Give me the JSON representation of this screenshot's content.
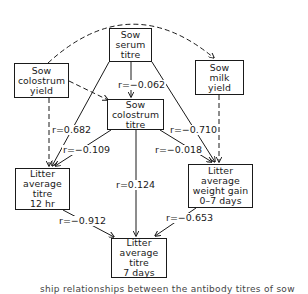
{
  "diagram": {
    "type": "path-diagram",
    "nodes": {
      "sow_serum_titre": {
        "lines": [
          "Sow",
          "serum",
          "titre"
        ]
      },
      "sow_colostrum_yield": {
        "lines": [
          "Sow",
          "colostrum",
          "yield"
        ]
      },
      "sow_milk_yield": {
        "lines": [
          "Sow",
          "milk",
          "yield"
        ]
      },
      "sow_colostrum_titre": {
        "lines": [
          "Sow",
          "colostrum",
          "titre"
        ]
      },
      "litter_titre_12hr": {
        "lines": [
          "Litter",
          "average",
          "titre",
          "12 hr"
        ]
      },
      "litter_weight_gain": {
        "lines": [
          "Litter",
          "average",
          "weight gain",
          "0–7 days"
        ]
      },
      "litter_titre_7days": {
        "lines": [
          "Litter",
          "average",
          "titre",
          "7 days"
        ]
      }
    },
    "correlations": {
      "serum_to_colostrum_titre": "r=−0.062",
      "colostrum_yield_to_12hr": "r=0.682",
      "colostrum_titre_to_12hr": "r=−0.109",
      "serum_to_weight_gain": "r=−0.710",
      "colostrum_titre_to_weight_gain": "r=−0.018",
      "colostrum_titre_to_7days": "r=0.124",
      "titre_12hr_to_7days": "r=−0.912",
      "weight_gain_to_7days": "r=−0.653"
    },
    "edges": [
      {
        "from": "Sow colostrum yield",
        "to": "Sow milk yield",
        "style": "dashed-arc"
      },
      {
        "from": "Sow colostrum yield",
        "to": "Sow colostrum titre",
        "style": "dashed"
      },
      {
        "from": "Sow colostrum yield",
        "to": "Litter average titre 12 hr",
        "style": "dashed"
      },
      {
        "from": "Sow milk yield",
        "to": "Litter average weight gain 0–7 days",
        "style": "dashed"
      },
      {
        "from": "Sow serum titre",
        "to": "Sow colostrum titre",
        "style": "solid"
      },
      {
        "from": "Sow serum titre",
        "to": "Litter average titre 12 hr",
        "style": "solid"
      },
      {
        "from": "Sow serum titre",
        "to": "Litter average weight gain 0–7 days",
        "style": "solid"
      },
      {
        "from": "Sow colostrum titre",
        "to": "Litter average titre 12 hr",
        "style": "solid"
      },
      {
        "from": "Sow colostrum titre",
        "to": "Litter average weight gain 0–7 days",
        "style": "solid"
      },
      {
        "from": "Sow colostrum titre",
        "to": "Litter average titre 7 days",
        "style": "solid"
      },
      {
        "from": "Litter average titre 12 hr",
        "to": "Litter average titre 7 days",
        "style": "solid"
      },
      {
        "from": "Litter average weight gain 0–7 days",
        "to": "Litter average titre 7 days",
        "style": "solid"
      }
    ]
  },
  "caption": "ship relationships between the antibody titres of sow"
}
